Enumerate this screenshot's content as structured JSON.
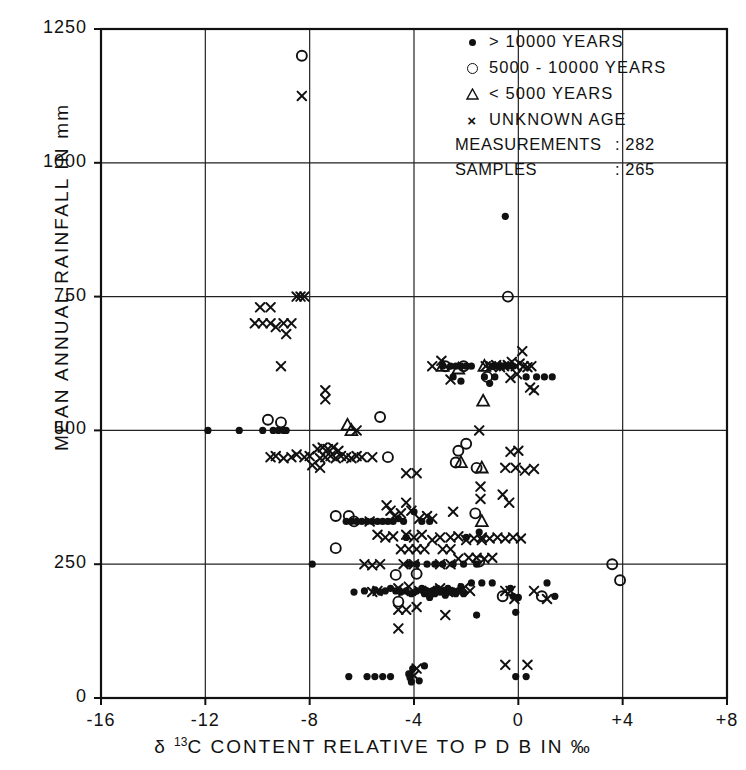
{
  "chart_data": {
    "type": "scatter",
    "title": "",
    "xlabel": "δ 13C CONTENT RELATIVE TO P D B IN ‰",
    "ylabel": "MEAN ANNUAL RAINFALL IN mm",
    "xlim": [
      -16,
      8
    ],
    "ylim": [
      0,
      1250
    ],
    "xticks": [
      -16,
      -12,
      -8,
      -4,
      0,
      4,
      8
    ],
    "xticklabels": [
      "-16",
      "-12",
      "-8",
      "-4",
      "0",
      "+4",
      "+8"
    ],
    "yticks": [
      0,
      250,
      500,
      750,
      1000,
      1250
    ],
    "yticklabels": [
      "0",
      "250",
      "500",
      "750",
      "1000",
      "1250"
    ],
    "grid": true,
    "legend_position": "top-right",
    "series": [
      {
        "name": "> 10000 YEARS",
        "marker": "filled-circle",
        "points": [
          [
            -11.9,
            500
          ],
          [
            -10.7,
            500
          ],
          [
            -9.8,
            500
          ],
          [
            -9.4,
            500
          ],
          [
            -9.2,
            500
          ],
          [
            -9.0,
            500
          ],
          [
            -8.9,
            500
          ],
          [
            -6.6,
            330
          ],
          [
            -6.4,
            330
          ],
          [
            -6.2,
            330
          ],
          [
            -6.0,
            330
          ],
          [
            -5.8,
            330
          ],
          [
            -5.6,
            330
          ],
          [
            -5.4,
            330
          ],
          [
            -5.2,
            330
          ],
          [
            -5.0,
            330
          ],
          [
            -4.8,
            330
          ],
          [
            -4.6,
            335
          ],
          [
            -4.4,
            330
          ],
          [
            -4.0,
            348
          ],
          [
            -3.7,
            330
          ],
          [
            -3.4,
            330
          ],
          [
            -2.9,
            620
          ],
          [
            -2.6,
            620
          ],
          [
            -2.4,
            620
          ],
          [
            -2.2,
            620
          ],
          [
            -2.0,
            620
          ],
          [
            -1.8,
            620
          ],
          [
            -2.5,
            600
          ],
          [
            -2.2,
            592
          ],
          [
            -1.0,
            620
          ],
          [
            -0.8,
            620
          ],
          [
            -0.6,
            620
          ],
          [
            -0.4,
            620
          ],
          [
            -0.2,
            620
          ],
          [
            -1.3,
            600
          ],
          [
            -1.1,
            588
          ],
          [
            -0.9,
            600
          ],
          [
            0.3,
            600
          ],
          [
            0.7,
            600
          ],
          [
            1.0,
            600
          ],
          [
            1.3,
            600
          ],
          [
            -0.5,
            900
          ],
          [
            -4.2,
            250
          ],
          [
            -3.9,
            250
          ],
          [
            -3.5,
            250
          ],
          [
            -3.2,
            250
          ],
          [
            -2.9,
            250
          ],
          [
            -2.5,
            250
          ],
          [
            -2.1,
            250
          ],
          [
            -1.6,
            250
          ],
          [
            -4.9,
            205
          ],
          [
            -4.7,
            200
          ],
          [
            -4.5,
            198
          ],
          [
            -4.3,
            200
          ],
          [
            -4.1,
            195
          ],
          [
            -3.9,
            200
          ],
          [
            -3.7,
            205
          ],
          [
            -3.6,
            195
          ],
          [
            -3.5,
            200
          ],
          [
            -3.4,
            188
          ],
          [
            -3.3,
            200
          ],
          [
            -3.2,
            195
          ],
          [
            -3.1,
            205
          ],
          [
            -3.0,
            198
          ],
          [
            -2.9,
            200
          ],
          [
            -2.8,
            192
          ],
          [
            -2.7,
            205
          ],
          [
            -2.6,
            198
          ],
          [
            -2.5,
            200
          ],
          [
            -2.4,
            195
          ],
          [
            -2.3,
            200
          ],
          [
            -2.2,
            208
          ],
          [
            -2.1,
            195
          ],
          [
            -5.1,
            200
          ],
          [
            -5.3,
            198
          ],
          [
            -5.5,
            202
          ],
          [
            -1.8,
            215
          ],
          [
            -1.4,
            215
          ],
          [
            -1.0,
            215
          ],
          [
            -0.3,
            205
          ],
          [
            -0.2,
            190
          ],
          [
            0.0,
            188
          ],
          [
            1.1,
            215
          ],
          [
            1.4,
            190
          ],
          [
            -0.1,
            160
          ],
          [
            -1.6,
            155
          ],
          [
            -5.9,
            200
          ],
          [
            -6.3,
            198
          ],
          [
            -7.9,
            250
          ],
          [
            -6.5,
            40
          ],
          [
            -5.8,
            40
          ],
          [
            -5.5,
            40
          ],
          [
            -5.2,
            40
          ],
          [
            -4.9,
            40
          ],
          [
            -4.2,
            45
          ],
          [
            -4.15,
            38
          ],
          [
            -4.1,
            30
          ],
          [
            -4.05,
            55
          ],
          [
            -3.8,
            32
          ],
          [
            -3.6,
            60
          ],
          [
            -0.1,
            40
          ],
          [
            0.3,
            40
          ],
          [
            -4.3,
            300
          ],
          [
            -2.0,
            300
          ],
          [
            -1.5,
            310
          ]
        ]
      },
      {
        "name": "5000 - 10000 YEARS",
        "marker": "open-circle",
        "points": [
          [
            -8.3,
            1200
          ],
          [
            -0.4,
            750
          ],
          [
            -9.6,
            520
          ],
          [
            -9.1,
            515
          ],
          [
            -5.3,
            525
          ],
          [
            -2.8,
            620
          ],
          [
            -2.1,
            620
          ],
          [
            -2.0,
            475
          ],
          [
            -2.3,
            462
          ],
          [
            -1.2,
            600
          ],
          [
            -7.0,
            340
          ],
          [
            -6.5,
            340
          ],
          [
            -6.3,
            330
          ],
          [
            -7.0,
            280
          ],
          [
            -4.7,
            230
          ],
          [
            -3.9,
            232
          ],
          [
            -1.6,
            430
          ],
          [
            -1.65,
            345
          ],
          [
            -0.6,
            190
          ],
          [
            0.9,
            190
          ],
          [
            3.6,
            250
          ],
          [
            3.9,
            220
          ],
          [
            -2.4,
            440
          ],
          [
            -5.0,
            450
          ],
          [
            -4.6,
            180
          ],
          [
            -1.5,
            255
          ]
        ]
      },
      {
        "name": "< 5000 YEARS",
        "marker": "open-triangle",
        "points": [
          [
            -6.4,
            500
          ],
          [
            -6.55,
            510
          ],
          [
            -2.9,
            620
          ],
          [
            -1.3,
            620
          ],
          [
            -1.35,
            555
          ],
          [
            -1.4,
            430
          ],
          [
            -1.4,
            330
          ],
          [
            -2.2,
            440
          ],
          [
            -2.3,
            615
          ]
        ]
      },
      {
        "name": "UNKNOWN AGE",
        "marker": "x",
        "points": [
          [
            -8.3,
            1125
          ],
          [
            -8.5,
            750
          ],
          [
            -8.35,
            750
          ],
          [
            -8.2,
            750
          ],
          [
            -9.9,
            730
          ],
          [
            -9.5,
            730
          ],
          [
            -10.1,
            700
          ],
          [
            -9.8,
            700
          ],
          [
            -9.5,
            700
          ],
          [
            -9.3,
            693
          ],
          [
            -9.0,
            700
          ],
          [
            -8.7,
            700
          ],
          [
            -8.9,
            680
          ],
          [
            -9.1,
            620
          ],
          [
            -7.4,
            575
          ],
          [
            -7.4,
            558
          ],
          [
            -3.3,
            620
          ],
          [
            -2.95,
            630
          ],
          [
            -1.25,
            620
          ],
          [
            -1.05,
            620
          ],
          [
            -0.85,
            622
          ],
          [
            -0.7,
            618
          ],
          [
            -0.55,
            620
          ],
          [
            -0.4,
            622
          ],
          [
            -0.25,
            628
          ],
          [
            -0.1,
            620
          ],
          [
            0.05,
            625
          ],
          [
            0.2,
            620
          ],
          [
            0.35,
            618
          ],
          [
            0.5,
            620
          ],
          [
            -0.3,
            598
          ],
          [
            -0.05,
            605
          ],
          [
            0.15,
            648
          ],
          [
            -2.6,
            595
          ],
          [
            -6.2,
            500
          ],
          [
            -1.5,
            500
          ],
          [
            -9.5,
            450
          ],
          [
            -9.3,
            452
          ],
          [
            -9.0,
            448
          ],
          [
            -8.7,
            450
          ],
          [
            -8.5,
            455
          ],
          [
            -8.2,
            450
          ],
          [
            -8.0,
            452
          ],
          [
            -7.7,
            465
          ],
          [
            -7.5,
            468
          ],
          [
            -7.3,
            465
          ],
          [
            -7.1,
            468
          ],
          [
            -6.9,
            462
          ],
          [
            -7.6,
            448
          ],
          [
            -7.4,
            450
          ],
          [
            -7.2,
            452
          ],
          [
            -7.0,
            448
          ],
          [
            -6.8,
            452
          ],
          [
            -6.6,
            450
          ],
          [
            -6.4,
            448
          ],
          [
            -6.2,
            452
          ],
          [
            -6.0,
            450
          ],
          [
            -5.6,
            450
          ],
          [
            -7.9,
            435
          ],
          [
            -7.6,
            430
          ],
          [
            -0.3,
            460
          ],
          [
            0.0,
            462
          ],
          [
            -0.5,
            430
          ],
          [
            -0.1,
            430
          ],
          [
            0.25,
            425
          ],
          [
            0.6,
            428
          ],
          [
            -4.3,
            420
          ],
          [
            -3.9,
            420
          ],
          [
            -5.05,
            360
          ],
          [
            -4.9,
            350
          ],
          [
            -4.75,
            340
          ],
          [
            -4.3,
            365
          ],
          [
            -4.1,
            350
          ],
          [
            -4.5,
            345
          ],
          [
            -3.8,
            335
          ],
          [
            -3.5,
            340
          ],
          [
            -3.3,
            335
          ],
          [
            -2.5,
            348
          ],
          [
            -1.45,
            395
          ],
          [
            -1.45,
            372
          ],
          [
            -1.4,
            300
          ],
          [
            -0.6,
            380
          ],
          [
            -0.35,
            365
          ],
          [
            -5.4,
            305
          ],
          [
            -5.1,
            300
          ],
          [
            -4.8,
            302
          ],
          [
            -4.3,
            305
          ],
          [
            -4.0,
            300
          ],
          [
            -3.7,
            305
          ],
          [
            -3.3,
            295
          ],
          [
            -3.0,
            300
          ],
          [
            -2.6,
            300
          ],
          [
            -2.3,
            302
          ],
          [
            -4.5,
            278
          ],
          [
            -4.2,
            278
          ],
          [
            -3.9,
            278
          ],
          [
            -3.6,
            278
          ],
          [
            -2.9,
            278
          ],
          [
            -2.6,
            278
          ],
          [
            -2.0,
            295
          ],
          [
            -1.7,
            298
          ],
          [
            -1.4,
            295
          ],
          [
            -1.1,
            298
          ],
          [
            -0.8,
            300
          ],
          [
            -0.5,
            298
          ],
          [
            -0.2,
            300
          ],
          [
            0.1,
            298
          ],
          [
            -1.9,
            262
          ],
          [
            -1.6,
            262
          ],
          [
            -1.3,
            260
          ],
          [
            -1.0,
            262
          ],
          [
            -2.3,
            260
          ],
          [
            -5.9,
            250
          ],
          [
            -5.6,
            248
          ],
          [
            -5.3,
            250
          ],
          [
            -4.4,
            250
          ],
          [
            -4.0,
            250
          ],
          [
            -3.0,
            250
          ],
          [
            -2.6,
            250
          ],
          [
            -4.6,
            205
          ],
          [
            -4.4,
            200
          ],
          [
            -4.2,
            208
          ],
          [
            -3.8,
            200
          ],
          [
            -3.4,
            200
          ],
          [
            -3.0,
            205
          ],
          [
            -2.7,
            198
          ],
          [
            -5.6,
            198
          ],
          [
            -5.4,
            200
          ],
          [
            -0.5,
            200
          ],
          [
            -0.3,
            200
          ],
          [
            -0.15,
            185
          ],
          [
            0.6,
            200
          ],
          [
            1.1,
            185
          ],
          [
            -4.6,
            165
          ],
          [
            -4.3,
            165
          ],
          [
            -4.6,
            130
          ],
          [
            -3.9,
            170
          ],
          [
            -2.8,
            155
          ],
          [
            -3.9,
            55
          ],
          [
            -4.0,
            42
          ],
          [
            -0.5,
            62
          ],
          [
            0.35,
            62
          ],
          [
            -5.7,
            330
          ],
          [
            -2.1,
            205
          ],
          [
            -1.85,
            200
          ],
          [
            0.45,
            580
          ],
          [
            0.6,
            575
          ]
        ]
      }
    ]
  },
  "legend": {
    "items": [
      {
        "symbol": "filled-circle",
        "label": "> 10000 YEARS"
      },
      {
        "symbol": "open-circle",
        "label": "5000 - 10000 YEARS"
      },
      {
        "symbol": "open-triangle",
        "label": "< 5000 YEARS"
      },
      {
        "symbol": "x",
        "label": "UNKNOWN AGE"
      }
    ],
    "stats": [
      {
        "label": "MEASUREMENTS",
        "value": ": 282"
      },
      {
        "label": "SAMPLES",
        "value": ": 265"
      }
    ]
  },
  "axes": {
    "ylabel": "MEAN ANNUAL RAINFALL IN mm",
    "xlabel_pre": "δ ",
    "xlabel_sup": "13",
    "xlabel_post": "C  CONTENT  RELATIVE  TO  P D B  IN  ‰"
  },
  "colors": {
    "ink": "#111111",
    "background": "#ffffff",
    "grid": "#222222"
  }
}
